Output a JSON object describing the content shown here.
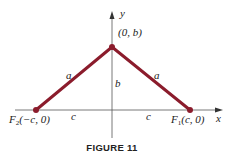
{
  "figure": {
    "caption": "FIGURE 11",
    "axes": {
      "x_label": "x",
      "y_label": "y"
    },
    "points": {
      "top": {
        "label": "(0, b)"
      },
      "left_focus": {
        "name": "F",
        "sub": "2",
        "coords": "(−c, 0)"
      },
      "right_focus": {
        "name": "F",
        "sub": "1",
        "coords": "(c, 0)"
      }
    },
    "segment_labels": {
      "left_hypotenuse": "a",
      "right_hypotenuse": "a",
      "height": "b",
      "left_base": "c",
      "right_base": "c"
    },
    "colors": {
      "segment": "#8b1c2c",
      "axis": "#444444",
      "text": "#222222"
    }
  }
}
